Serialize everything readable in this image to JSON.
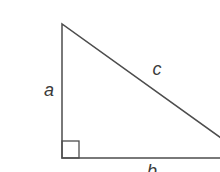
{
  "diagram": {
    "type": "right-triangle",
    "labels": {
      "vertical_leg": "a",
      "horizontal_leg": "b",
      "hypotenuse": "c"
    },
    "features": {
      "right_angle_marker": "square at bottom-left corner"
    },
    "colors": {
      "line": "#4d4d4d",
      "label": "#3a3a3a",
      "background": "#ffffff"
    }
  }
}
